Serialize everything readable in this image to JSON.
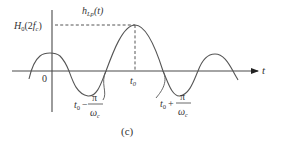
{
  "figure": {
    "caption": "(c)",
    "axis": {
      "x_label": "t",
      "origin_label": "0"
    },
    "curve_label": {
      "main": "h",
      "sub": "Lp",
      "arg": "(t)"
    },
    "peak_label": {
      "main": "H",
      "sub": "0",
      "arg_open": "(2",
      "arg_f": "f",
      "arg_sub": "c",
      "arg_close": ")"
    },
    "peak_time_label": {
      "main": "t",
      "sub": "0"
    },
    "left_zero_label": {
      "t": "t",
      "sub": "0",
      "op": "−",
      "num": "π",
      "den": "ω",
      "den_sub": "c"
    },
    "right_zero_label": {
      "t": "t",
      "sub": "0",
      "op": "+",
      "num": "π",
      "den": "ω",
      "den_sub": "c"
    },
    "colors": {
      "line": "#555555",
      "axis": "#4a4a4a",
      "text": "#333333"
    }
  }
}
